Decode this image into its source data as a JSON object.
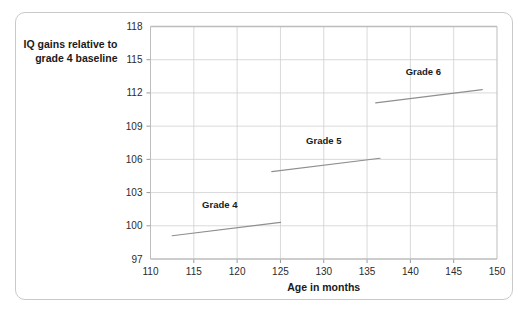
{
  "chart_data": {
    "type": "line",
    "title": "",
    "xlabel": "Age in months",
    "ylabel": "IQ gains relative to grade 4 baseline",
    "ylabel_lines": [
      "IQ gains relative to",
      "grade 4 baseline"
    ],
    "xlim": [
      110,
      150
    ],
    "ylim": [
      97,
      118
    ],
    "xticks": [
      110,
      115,
      120,
      125,
      130,
      135,
      140,
      145,
      150
    ],
    "yticks": [
      97,
      100,
      103,
      106,
      109,
      112,
      115,
      118
    ],
    "xtick_labels": [
      "110",
      "115",
      "120",
      "125",
      "130",
      "135",
      "140",
      "145",
      "150"
    ],
    "ytick_labels": [
      "97",
      "100",
      "103",
      "106",
      "109",
      "112",
      "115",
      "118"
    ],
    "grid": true,
    "legend": "inline-annotations",
    "series": [
      {
        "name": "Grade 4",
        "label": "Grade 4",
        "x": [
          112.5,
          125.0
        ],
        "values": [
          99.1,
          100.3
        ],
        "label_x": 118.0,
        "label_y": 101.6
      },
      {
        "name": "Grade 5",
        "label": "Grade 5",
        "x": [
          124.0,
          136.5
        ],
        "values": [
          104.9,
          106.1
        ],
        "label_x": 130.0,
        "label_y": 107.4
      },
      {
        "name": "Grade 6",
        "label": "Grade 6",
        "x": [
          136.0,
          148.3
        ],
        "values": [
          111.1,
          112.3
        ],
        "label_x": 141.5,
        "label_y": 113.6
      }
    ],
    "colors": {
      "line": "#8f8f8f",
      "grid": "#cfcfcf",
      "axis": "#bdbdbd",
      "text": "#1a1a1a",
      "frame": "#c9c9c9",
      "background": "#ffffff"
    }
  }
}
